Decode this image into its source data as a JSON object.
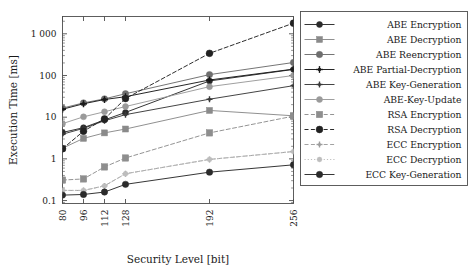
{
  "chart_data": {
    "type": "line",
    "title": "",
    "xlabel": "Security Level [bit]",
    "ylabel": "Execution Time [ms]",
    "x_categories": [
      "80",
      "96",
      "112",
      "128",
      "192",
      "256"
    ],
    "x_values": [
      80,
      96,
      112,
      128,
      192,
      256
    ],
    "yscale": "log",
    "ylim": [
      0.085,
      2600
    ],
    "y_ticks": [
      "0.1",
      "1",
      "10",
      "100",
      "1 000"
    ],
    "y_tick_values": [
      0.1,
      1,
      10,
      100,
      1000
    ],
    "grid": false,
    "legend_position": "right-outside",
    "series": [
      {
        "name": "ABE Encryption",
        "values": [
          4.3,
          5.6,
          8.6,
          13.0,
          74.0,
          140.0
        ],
        "color": "#2b2b2b",
        "dash": "none",
        "marker": "circle",
        "marker_size": 3.0
      },
      {
        "name": "ABE Decryption",
        "values": [
          1.8,
          3.1,
          4.2,
          5.2,
          14.5,
          10.8
        ],
        "color": "#8a8a8a",
        "dash": "none",
        "marker": "square",
        "marker_size": 3.0
      },
      {
        "name": "ABE Reencryption",
        "values": [
          16.5,
          22.0,
          27.5,
          36.5,
          105.0,
          205.0
        ],
        "color": "#6e6e6e",
        "dash": "none",
        "marker": "circle",
        "marker_size": 3.2
      },
      {
        "name": "ABE Partial-Decryption",
        "values": [
          15.5,
          21.0,
          26.5,
          31.0,
          78.0,
          142.0
        ],
        "color": "#1a1a1a",
        "dash": "none",
        "marker": "plus",
        "marker_size": 3.4
      },
      {
        "name": "ABE Key-Generation",
        "values": [
          3.9,
          5.4,
          8.2,
          11.5,
          27.0,
          57.0
        ],
        "color": "#3a3a3a",
        "dash": "none",
        "marker": "plus",
        "marker_size": 3.0
      },
      {
        "name": "ABE-Key-Update",
        "values": [
          7.0,
          10.2,
          13.5,
          18.0,
          54.0,
          100.0
        ],
        "color": "#9a9a9a",
        "dash": "none",
        "marker": "circle",
        "marker_size": 3.0
      },
      {
        "name": "RSA Encryption",
        "values": [
          0.31,
          0.33,
          0.64,
          1.05,
          4.2,
          10.6
        ],
        "color": "#8e8e8e",
        "dash": "dash",
        "marker": "square",
        "marker_size": 3.2
      },
      {
        "name": "RSA Decryption",
        "values": [
          1.75,
          4.6,
          9.1,
          28.0,
          340.0,
          1800.0
        ],
        "color": "#222222",
        "dash": "dash",
        "marker": "circle",
        "marker_size": 3.4
      },
      {
        "name": "ECC Encryption",
        "values": [
          0.175,
          0.175,
          0.225,
          0.44,
          0.97,
          1.5
        ],
        "color": "#9d9d9d",
        "dash": "dash",
        "marker": "plus",
        "marker_size": 3.0
      },
      {
        "name": "ECC Decryption",
        "values": [
          0.175,
          0.175,
          0.225,
          0.44,
          0.97,
          1.5
        ],
        "color": "#bdbdbd",
        "dash": "dot",
        "marker": "circle",
        "marker_size": 2.4
      },
      {
        "name": "ECC Key-Generation",
        "values": [
          0.135,
          0.14,
          0.16,
          0.245,
          0.48,
          0.72
        ],
        "color": "#2b2b2b",
        "dash": "none",
        "marker": "circle",
        "marker_size": 3.2
      }
    ]
  },
  "legend": {
    "entries": [
      "ABE Encryption",
      "ABE Decryption",
      "ABE Reencryption",
      "ABE Partial-Decryption",
      "ABE Key-Generation",
      "ABE-Key-Update",
      "RSA Encryption",
      "RSA Decryption",
      "ECC Encryption",
      "ECC Decryption",
      "ECC Key-Generation"
    ]
  },
  "style": {
    "frame_color": "#4d4d4d",
    "text_color": "#1a1a1a",
    "background": "#ffffff"
  }
}
